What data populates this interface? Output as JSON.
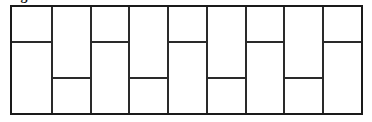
{
  "caption": {
    "text": "Figure"
  },
  "figure": {
    "columns": 9,
    "line_color": "#1a1a1a",
    "background": "#ffffff",
    "cells": [
      {
        "col": 1,
        "split": "top",
        "split_fraction": 0.333
      },
      {
        "col": 2,
        "split": "bottom",
        "split_fraction": 0.667
      },
      {
        "col": 3,
        "split": "top",
        "split_fraction": 0.333
      },
      {
        "col": 4,
        "split": "bottom",
        "split_fraction": 0.667
      },
      {
        "col": 5,
        "split": "top",
        "split_fraction": 0.333
      },
      {
        "col": 6,
        "split": "bottom",
        "split_fraction": 0.667
      },
      {
        "col": 7,
        "split": "top",
        "split_fraction": 0.333
      },
      {
        "col": 8,
        "split": "bottom",
        "split_fraction": 0.667
      },
      {
        "col": 9,
        "split": "top",
        "split_fraction": 0.333
      }
    ]
  }
}
